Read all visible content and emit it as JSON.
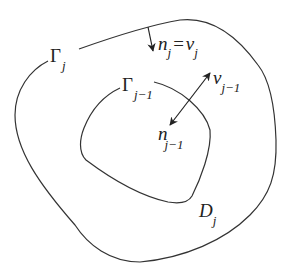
{
  "diagram": {
    "type": "nested-regions",
    "outer_boundary": {
      "label_symbol": "Γ",
      "label_subscript": "j"
    },
    "inner_boundary": {
      "label_symbol": "Γ",
      "label_subscript": "j−1"
    },
    "region": {
      "label_symbol": "D",
      "label_subscript": "j"
    },
    "outer_normal": {
      "lhs_symbol": "n",
      "lhs_subscript": "j",
      "equals": "=",
      "rhs_symbol": "v",
      "rhs_subscript": "j"
    },
    "inner_vectors": {
      "outward_symbol": "v",
      "outward_subscript": "j−1",
      "inward_symbol": "n",
      "inward_subscript": "j−1"
    },
    "colors": {
      "stroke": "#333333",
      "text": "#222222",
      "background": "#ffffff"
    }
  }
}
